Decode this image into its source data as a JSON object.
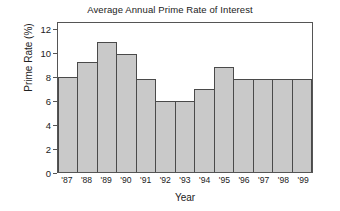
{
  "chart_data": {
    "type": "bar",
    "title": "Average Annual Prime Rate of Interest",
    "xlabel": "Year",
    "ylabel": "Prime Rate (%)",
    "categories": [
      "'87",
      "'88",
      "'89",
      "'90",
      "'91",
      "'92",
      "'93",
      "'94",
      "'95",
      "'96",
      "'97",
      "'98",
      "'99"
    ],
    "values": [
      8.0,
      9.3,
      11.0,
      10.0,
      7.9,
      6.0,
      6.0,
      7.0,
      8.9,
      7.9,
      7.9,
      7.9,
      7.9
    ],
    "ylim": [
      0,
      12.6
    ],
    "yticks": [
      0,
      2,
      4,
      6,
      8,
      10,
      12
    ],
    "ytick_labels": [
      "0",
      "2",
      "4",
      "6",
      "8",
      "10",
      "12"
    ],
    "grid": false,
    "legend": false,
    "bar_fill_color": "#c9c9c9",
    "bar_edge_color": "#4a4a4a",
    "frame_color": "#555555",
    "background_color": "#ffffff"
  }
}
